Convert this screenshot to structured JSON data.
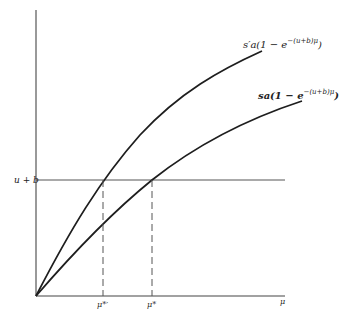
{
  "diagram": {
    "axes": {
      "x_label": "μ",
      "y_label": ""
    },
    "horizontal_line": {
      "label": "u + b"
    },
    "curves": [
      {
        "id": "upper",
        "label_prefix": "s′a(1 − e",
        "label_exponent": "−(u+b)μ",
        "label_suffix": ")"
      },
      {
        "id": "lower",
        "label_prefix": "sa(1 − e",
        "label_exponent": "−(u+b)μ",
        "label_suffix": ")"
      }
    ],
    "x_markers": [
      {
        "label": "μ*′"
      },
      {
        "label": "μ*"
      }
    ],
    "colors": {
      "line": "#1e1e1e",
      "axis": "#444444",
      "dash": "#555555"
    }
  }
}
